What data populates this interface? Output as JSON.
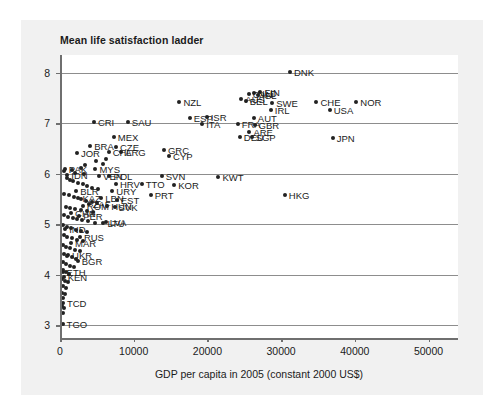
{
  "chart_data": {
    "type": "scatter",
    "title": "Mean life satisfaction ladder",
    "xlabel": "GDP per capita in 2005 (constant 2000 US$)",
    "ylabel": "",
    "xlim": [
      0,
      54000
    ],
    "ylim": [
      2.75,
      8.35
    ],
    "grid": "horizontal",
    "legend": "none",
    "xticks": [
      "0",
      "10000",
      "20000",
      "30000",
      "40000",
      "50000"
    ],
    "xtick_values": [
      0,
      10000,
      20000,
      30000,
      40000,
      50000
    ],
    "yticks": [
      "3",
      "4",
      "5",
      "6",
      "7",
      "8"
    ],
    "ytick_values": [
      3,
      4,
      5,
      6,
      7,
      8
    ],
    "points": [
      {
        "label": "DNK",
        "x": 31200,
        "y": 8.02,
        "lp": "right"
      },
      {
        "label": "FIN",
        "x": 27200,
        "y": 7.62,
        "lp": "right"
      },
      {
        "label": "NLD",
        "x": 26300,
        "y": 7.6,
        "lp": "right"
      },
      {
        "label": "CAN",
        "x": 25600,
        "y": 7.58,
        "lp": "right"
      },
      {
        "label": "ISL",
        "x": 26900,
        "y": 7.55,
        "lp": "right"
      },
      {
        "label": "BEL",
        "x": 25200,
        "y": 7.44,
        "lp": "right"
      },
      {
        "label": "AUS",
        "x": 24600,
        "y": 7.47,
        "lp": "right"
      },
      {
        "label": "NZL",
        "x": 16200,
        "y": 7.42,
        "lp": "right"
      },
      {
        "label": "SWE",
        "x": 28800,
        "y": 7.4,
        "lp": "right"
      },
      {
        "label": "CHE",
        "x": 34800,
        "y": 7.42,
        "lp": "right"
      },
      {
        "label": "NOR",
        "x": 40200,
        "y": 7.42,
        "lp": "right"
      },
      {
        "label": "IRL",
        "x": 28600,
        "y": 7.27,
        "lp": "right"
      },
      {
        "label": "USA",
        "x": 36600,
        "y": 7.26,
        "lp": "right"
      },
      {
        "label": "ESP",
        "x": 17600,
        "y": 7.1,
        "lp": "right"
      },
      {
        "label": "ISR",
        "x": 19900,
        "y": 7.13,
        "lp": "right"
      },
      {
        "label": "AUT",
        "x": 26300,
        "y": 7.1,
        "lp": "right"
      },
      {
        "label": "CRI",
        "x": 4600,
        "y": 7.02,
        "lp": "right"
      },
      {
        "label": "SAU",
        "x": 9200,
        "y": 7.02,
        "lp": "right"
      },
      {
        "label": "ITA",
        "x": 19300,
        "y": 6.98,
        "lp": "right"
      },
      {
        "label": "FRA",
        "x": 24100,
        "y": 6.98,
        "lp": "right"
      },
      {
        "label": "GBR",
        "x": 26400,
        "y": 6.97,
        "lp": "right"
      },
      {
        "label": "ARE",
        "x": 25700,
        "y": 6.82,
        "lp": "right"
      },
      {
        "label": "DEU",
        "x": 24400,
        "y": 6.72,
        "lp": "right"
      },
      {
        "label": "SGP",
        "x": 26000,
        "y": 6.72,
        "lp": "right"
      },
      {
        "label": "JPN",
        "x": 37000,
        "y": 6.7,
        "lp": "right"
      },
      {
        "label": "MEX",
        "x": 7300,
        "y": 6.72,
        "lp": "right"
      },
      {
        "label": "BRA",
        "x": 4100,
        "y": 6.55,
        "lp": "right"
      },
      {
        "label": "CZE",
        "x": 7600,
        "y": 6.53,
        "lp": "right"
      },
      {
        "label": "GRC",
        "x": 14100,
        "y": 6.48,
        "lp": "right"
      },
      {
        "label": "ARG",
        "x": 8300,
        "y": 6.43,
        "lp": "right"
      },
      {
        "label": "CHL",
        "x": 6600,
        "y": 6.44,
        "lp": "right"
      },
      {
        "label": "JOR",
        "x": 2300,
        "y": 6.42,
        "lp": "right"
      },
      {
        "label": "CYP",
        "x": 14800,
        "y": 6.36,
        "lp": "right"
      },
      {
        "label": "PAK",
        "x": 650,
        "y": 6.1,
        "lp": "right"
      },
      {
        "label": "MYS",
        "x": 4800,
        "y": 6.09,
        "lp": "right"
      },
      {
        "label": "IDN",
        "x": 1000,
        "y": 5.98,
        "lp": "right"
      },
      {
        "label": "VEN",
        "x": 5300,
        "y": 5.96,
        "lp": "right"
      },
      {
        "label": "POL",
        "x": 6700,
        "y": 5.96,
        "lp": "right"
      },
      {
        "label": "SVN",
        "x": 13800,
        "y": 5.95,
        "lp": "right"
      },
      {
        "label": "KWT",
        "x": 21500,
        "y": 5.94,
        "lp": "right"
      },
      {
        "label": "HRV",
        "x": 7600,
        "y": 5.8,
        "lp": "right"
      },
      {
        "label": "TTO",
        "x": 11100,
        "y": 5.79,
        "lp": "right"
      },
      {
        "label": "KOR",
        "x": 15500,
        "y": 5.77,
        "lp": "right"
      },
      {
        "label": "BLR",
        "x": 2200,
        "y": 5.66,
        "lp": "right"
      },
      {
        "label": "URY",
        "x": 7100,
        "y": 5.66,
        "lp": "right"
      },
      {
        "label": "HKG",
        "x": 30500,
        "y": 5.58,
        "lp": "right"
      },
      {
        "label": "PRT",
        "x": 12300,
        "y": 5.58,
        "lp": "right"
      },
      {
        "label": "KAZ",
        "x": 2500,
        "y": 5.52,
        "lp": "right"
      },
      {
        "label": "LBN",
        "x": 5600,
        "y": 5.52,
        "lp": "right"
      },
      {
        "label": "EST",
        "x": 7700,
        "y": 5.48,
        "lp": "right"
      },
      {
        "label": "ZAF",
        "x": 3900,
        "y": 5.4,
        "lp": "right"
      },
      {
        "label": "ROM",
        "x": 3100,
        "y": 5.37,
        "lp": "right"
      },
      {
        "label": "HUN",
        "x": 6400,
        "y": 5.37,
        "lp": "right"
      },
      {
        "label": "SVK",
        "x": 7400,
        "y": 5.35,
        "lp": "right"
      },
      {
        "label": "CHN",
        "x": 1500,
        "y": 5.22,
        "lp": "right"
      },
      {
        "label": "PER",
        "x": 2600,
        "y": 5.17,
        "lp": "right"
      },
      {
        "label": "LVA",
        "x": 6200,
        "y": 5.05,
        "lp": "right"
      },
      {
        "label": "LTU",
        "x": 5900,
        "y": 5.03,
        "lp": "right"
      },
      {
        "label": "IND",
        "x": 700,
        "y": 4.9,
        "lp": "right"
      },
      {
        "label": "RUS",
        "x": 2700,
        "y": 4.75,
        "lp": "right"
      },
      {
        "label": "MAR",
        "x": 1500,
        "y": 4.62,
        "lp": "right"
      },
      {
        "label": "UKR",
        "x": 1100,
        "y": 4.4,
        "lp": "right"
      },
      {
        "label": "BGR",
        "x": 2400,
        "y": 4.28,
        "lp": "right"
      },
      {
        "label": "ETH",
        "x": 350,
        "y": 4.05,
        "lp": "right"
      },
      {
        "label": "KEN",
        "x": 500,
        "y": 3.95,
        "lp": "right"
      },
      {
        "label": "TCD",
        "x": 400,
        "y": 3.45,
        "lp": "right"
      },
      {
        "label": "TGO",
        "x": 350,
        "y": 3.02,
        "lp": "right"
      },
      {
        "label": "",
        "x": 500,
        "y": 6.05
      },
      {
        "label": "",
        "x": 900,
        "y": 5.92
      },
      {
        "label": "",
        "x": 1300,
        "y": 5.88
      },
      {
        "label": "",
        "x": 1800,
        "y": 5.85
      },
      {
        "label": "",
        "x": 2400,
        "y": 5.82
      },
      {
        "label": "",
        "x": 3100,
        "y": 5.8
      },
      {
        "label": "",
        "x": 3700,
        "y": 5.76
      },
      {
        "label": "",
        "x": 4400,
        "y": 5.72
      },
      {
        "label": "",
        "x": 5100,
        "y": 5.7
      },
      {
        "label": "",
        "x": 600,
        "y": 5.6
      },
      {
        "label": "",
        "x": 1200,
        "y": 5.58
      },
      {
        "label": "",
        "x": 1900,
        "y": 5.55
      },
      {
        "label": "",
        "x": 2800,
        "y": 5.5
      },
      {
        "label": "",
        "x": 3500,
        "y": 5.46
      },
      {
        "label": "",
        "x": 4300,
        "y": 5.44
      },
      {
        "label": "",
        "x": 5000,
        "y": 5.42
      },
      {
        "label": "",
        "x": 800,
        "y": 5.35
      },
      {
        "label": "",
        "x": 1400,
        "y": 5.32
      },
      {
        "label": "",
        "x": 2100,
        "y": 5.3
      },
      {
        "label": "",
        "x": 2900,
        "y": 5.28
      },
      {
        "label": "",
        "x": 3600,
        "y": 5.26
      },
      {
        "label": "",
        "x": 4500,
        "y": 5.24
      },
      {
        "label": "",
        "x": 600,
        "y": 5.18
      },
      {
        "label": "",
        "x": 1100,
        "y": 5.15
      },
      {
        "label": "",
        "x": 1700,
        "y": 5.12
      },
      {
        "label": "",
        "x": 2300,
        "y": 5.1
      },
      {
        "label": "",
        "x": 3000,
        "y": 5.08
      },
      {
        "label": "",
        "x": 3800,
        "y": 5.06
      },
      {
        "label": "",
        "x": 4700,
        "y": 5.02
      },
      {
        "label": "",
        "x": 450,
        "y": 4.98
      },
      {
        "label": "",
        "x": 900,
        "y": 4.95
      },
      {
        "label": "",
        "x": 1500,
        "y": 4.92
      },
      {
        "label": "",
        "x": 2200,
        "y": 4.88
      },
      {
        "label": "",
        "x": 2900,
        "y": 4.86
      },
      {
        "label": "",
        "x": 3600,
        "y": 4.84
      },
      {
        "label": "",
        "x": 550,
        "y": 4.78
      },
      {
        "label": "",
        "x": 1000,
        "y": 4.74
      },
      {
        "label": "",
        "x": 1600,
        "y": 4.72
      },
      {
        "label": "",
        "x": 2300,
        "y": 4.68
      },
      {
        "label": "",
        "x": 3100,
        "y": 4.66
      },
      {
        "label": "",
        "x": 400,
        "y": 4.6
      },
      {
        "label": "",
        "x": 850,
        "y": 4.56
      },
      {
        "label": "",
        "x": 1400,
        "y": 4.54
      },
      {
        "label": "",
        "x": 2000,
        "y": 4.5
      },
      {
        "label": "",
        "x": 2700,
        "y": 4.48
      },
      {
        "label": "",
        "x": 500,
        "y": 4.42
      },
      {
        "label": "",
        "x": 1000,
        "y": 4.38
      },
      {
        "label": "",
        "x": 1600,
        "y": 4.35
      },
      {
        "label": "",
        "x": 2200,
        "y": 4.32
      },
      {
        "label": "",
        "x": 400,
        "y": 4.25
      },
      {
        "label": "",
        "x": 800,
        "y": 4.22
      },
      {
        "label": "",
        "x": 1300,
        "y": 4.18
      },
      {
        "label": "",
        "x": 1900,
        "y": 4.15
      },
      {
        "label": "",
        "x": 350,
        "y": 4.1
      },
      {
        "label": "",
        "x": 750,
        "y": 4.06
      },
      {
        "label": "",
        "x": 1200,
        "y": 4.02
      },
      {
        "label": "",
        "x": 300,
        "y": 3.92
      },
      {
        "label": "",
        "x": 700,
        "y": 3.88
      },
      {
        "label": "",
        "x": 1100,
        "y": 3.85
      },
      {
        "label": "",
        "x": 350,
        "y": 3.78
      },
      {
        "label": "",
        "x": 800,
        "y": 3.74
      },
      {
        "label": "",
        "x": 300,
        "y": 3.65
      },
      {
        "label": "",
        "x": 650,
        "y": 3.62
      },
      {
        "label": "",
        "x": 400,
        "y": 3.55
      },
      {
        "label": "",
        "x": 300,
        "y": 3.38
      },
      {
        "label": "",
        "x": 600,
        "y": 3.35
      },
      {
        "label": "",
        "x": 350,
        "y": 3.25
      },
      {
        "label": "",
        "x": 2000,
        "y": 6.02
      },
      {
        "label": "",
        "x": 3200,
        "y": 6.0
      },
      {
        "label": "",
        "x": 1600,
        "y": 6.08
      },
      {
        "label": "",
        "x": 2800,
        "y": 6.12
      },
      {
        "label": "",
        "x": 3400,
        "y": 6.18
      },
      {
        "label": "",
        "x": 5800,
        "y": 6.2
      },
      {
        "label": "",
        "x": 4900,
        "y": 6.26
      },
      {
        "label": "",
        "x": 6200,
        "y": 6.3
      }
    ]
  }
}
